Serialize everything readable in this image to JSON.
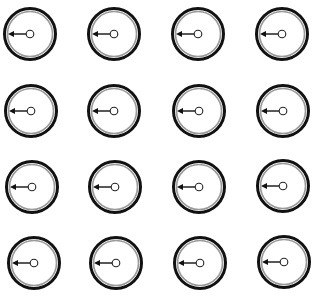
{
  "diagram": {
    "type": "dial-grid",
    "rows": 4,
    "cols": 4,
    "colors": {
      "background": "#ffffff",
      "outer_ring": "#111111",
      "inner_ring": "#9a9a9a",
      "arrow": "#111111",
      "hub_fill": "#ffffff",
      "hub_stroke": "#222222"
    },
    "style": {
      "outer_radius": 25.5,
      "outer_ring_width": 3,
      "inner_radius": 22.5,
      "inner_ring_width": 1.6,
      "hub_radius": 3.8,
      "arrow_direction": "left",
      "arrow_head_size": 5
    },
    "dials": [
      {
        "row": 0,
        "col": 0,
        "cx": 30,
        "cy": 34,
        "direction": "left"
      },
      {
        "row": 0,
        "col": 1,
        "cx": 114,
        "cy": 34,
        "direction": "left"
      },
      {
        "row": 0,
        "col": 2,
        "cx": 198,
        "cy": 34,
        "direction": "left"
      },
      {
        "row": 0,
        "col": 3,
        "cx": 282,
        "cy": 34,
        "direction": "left"
      },
      {
        "row": 1,
        "col": 0,
        "cx": 31,
        "cy": 111,
        "direction": "left"
      },
      {
        "row": 1,
        "col": 1,
        "cx": 114,
        "cy": 111,
        "direction": "left"
      },
      {
        "row": 1,
        "col": 2,
        "cx": 199,
        "cy": 111,
        "direction": "left"
      },
      {
        "row": 1,
        "col": 3,
        "cx": 283,
        "cy": 111,
        "direction": "left"
      },
      {
        "row": 2,
        "col": 0,
        "cx": 32,
        "cy": 187,
        "direction": "left"
      },
      {
        "row": 2,
        "col": 1,
        "cx": 115,
        "cy": 187,
        "direction": "left"
      },
      {
        "row": 2,
        "col": 2,
        "cx": 199,
        "cy": 187,
        "direction": "left"
      },
      {
        "row": 2,
        "col": 3,
        "cx": 283,
        "cy": 186,
        "direction": "left"
      },
      {
        "row": 3,
        "col": 0,
        "cx": 34,
        "cy": 263,
        "direction": "left"
      },
      {
        "row": 3,
        "col": 1,
        "cx": 116,
        "cy": 263,
        "direction": "left"
      },
      {
        "row": 3,
        "col": 2,
        "cx": 200,
        "cy": 263,
        "direction": "left"
      },
      {
        "row": 3,
        "col": 3,
        "cx": 284,
        "cy": 262,
        "direction": "left"
      }
    ]
  }
}
